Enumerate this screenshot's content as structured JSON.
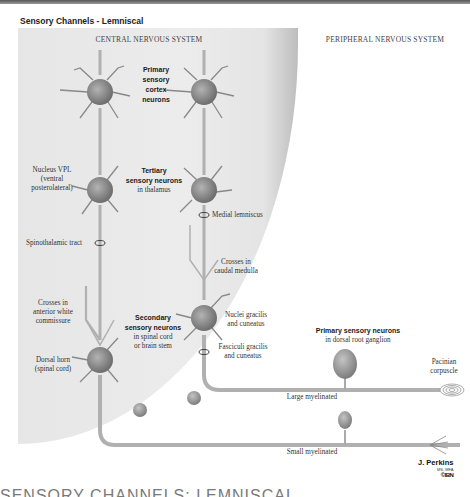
{
  "figure": {
    "title": "Sensory Channels - Lemniscal",
    "regions": {
      "central": "CENTRAL NERVOUS SYSTEM",
      "peripheral": "PERIPHERAL NERVOUS SYSTEM"
    },
    "labels": {
      "primary_cortex_line1": "Primary",
      "primary_cortex_line2": "sensory",
      "primary_cortex_line3": "cortex",
      "primary_cortex_line4": "neurons",
      "nucleus_vpl_line1": "Nucleus VPL",
      "nucleus_vpl_line2": "(ventral",
      "nucleus_vpl_line3": "posterolateral)",
      "tertiary_line1": "Tertiary",
      "tertiary_line2": "sensory neurons",
      "tertiary_line3": "in thalamus",
      "medial_lemniscus": "Medial lemniscus",
      "spinothalamic": "Spinothalamic tract",
      "crosses_medulla_line1": "Crosses in",
      "crosses_medulla_line2": "caudal medulla",
      "crosses_anterior_line1": "Crosses in",
      "crosses_anterior_line2": "anterior white",
      "crosses_anterior_line3": "commissure",
      "secondary_line1": "Secondary",
      "secondary_line2": "sensory neurons",
      "secondary_line3": "in spinal cord",
      "secondary_line4": "or brain stem",
      "nuclei_gracilis_line1": "Nuclei gracilis",
      "nuclei_gracilis_line2": "and cuneatus",
      "fasciculi_line1": "Fasciculi gracilis",
      "fasciculi_line2": "and cuneatus",
      "dorsal_horn_line1": "Dorsal horn",
      "dorsal_horn_line2": "(spinal cord)",
      "primary_drg_line1": "Primary sensory neurons",
      "primary_drg_line2": "in dorsal root ganglion",
      "pacinian_line1": "Pacinian",
      "pacinian_line2": "corpuscle",
      "large_myelinated": "Large myelinated",
      "small_myelinated": "Small myelinated"
    },
    "signature": {
      "name": "J. Perkins",
      "degrees": "MS, MFA",
      "logo": "©IBN"
    },
    "caption_cut": "SENSORY CHANNELS: LEMNISCAL"
  },
  "colors": {
    "cns_bg": "#e8e8e8",
    "neuron": "#8a8a8a",
    "axon": "#b5b5b5",
    "text": "#2a2a2a"
  }
}
